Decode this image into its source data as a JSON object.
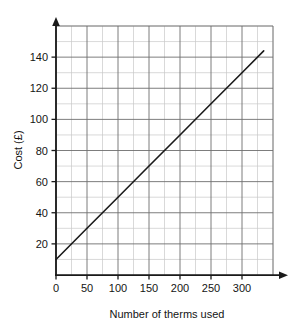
{
  "chart_data": {
    "type": "line",
    "title": "",
    "xlabel": "Number of therms used",
    "ylabel": "Cost (£)",
    "xlim": [
      0,
      350
    ],
    "ylim": [
      0,
      160
    ],
    "grid": true,
    "legend": "none",
    "x_major_ticks": [
      0,
      50,
      100,
      150,
      200,
      250,
      300
    ],
    "x_major_tick_labels": [
      "0",
      "50",
      "100",
      "150",
      "200",
      "250",
      "300"
    ],
    "x_minor_step": 25,
    "y_major_ticks": [
      20,
      40,
      60,
      80,
      100,
      120,
      140
    ],
    "y_major_tick_labels": [
      "20",
      "40",
      "60",
      "80",
      "100",
      "120",
      "140"
    ],
    "y_minor_step": 10,
    "series": [
      {
        "name": "Cost of gas",
        "x": [
          0,
          50,
          100,
          150,
          200,
          250,
          300,
          335
        ],
        "values": [
          10,
          30,
          50,
          70,
          90,
          110,
          130,
          144
        ],
        "intercept": 10,
        "slope": 0.4,
        "color": "#1a1a1a"
      }
    ],
    "annotations": []
  },
  "axes": {
    "x_arrow": "arrow-right",
    "y_arrow": "arrow-up",
    "axis_color": "#1a1a1a",
    "major_grid_color": "#6e6e6e",
    "minor_grid_color": "#c8c8c8"
  }
}
